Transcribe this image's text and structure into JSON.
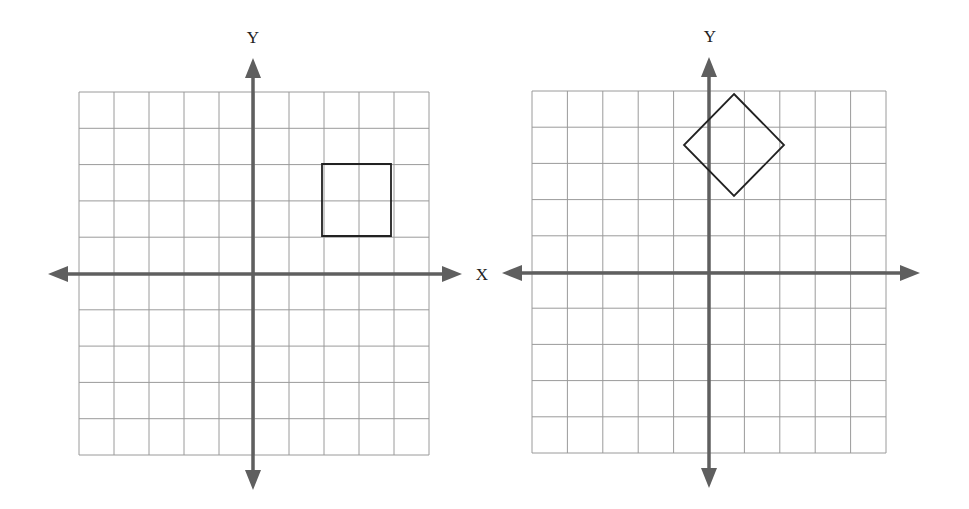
{
  "figure": {
    "colors": {
      "grid": "#9a9a9a",
      "axis": "#5f5f5f",
      "shape": "#222222",
      "background": "#ffffff"
    }
  },
  "graphs": [
    {
      "id": "left",
      "x_label": "X",
      "y_label": "Y",
      "grid": {
        "x0": 79,
        "y0": 92,
        "x1": 429,
        "y1": 455,
        "cols": 10,
        "rows": 10
      },
      "axes": {
        "y_axis_x": 253,
        "x_axis_y": 274,
        "x_left_tip": 48,
        "x_right_tip": 462,
        "y_top_tip": 58,
        "y_bottom_tip": 490
      },
      "shape": {
        "type": "square",
        "points": [
          [
            322,
            164
          ],
          [
            391,
            164
          ],
          [
            391,
            236
          ],
          [
            322,
            236
          ]
        ]
      },
      "label_positions": {
        "y": [
          253,
          38
        ],
        "x": [
          482,
          275
        ]
      }
    },
    {
      "id": "right",
      "x_label": "",
      "y_label": "Y",
      "grid": {
        "x0": 532,
        "y0": 91,
        "x1": 886,
        "y1": 453,
        "cols": 10,
        "rows": 10
      },
      "axes": {
        "y_axis_x": 709,
        "x_axis_y": 273,
        "x_left_tip": 502,
        "x_right_tip": 920,
        "y_top_tip": 57,
        "y_bottom_tip": 488
      },
      "shape": {
        "type": "rotated-square",
        "points": [
          [
            734,
            94
          ],
          [
            784,
            145
          ],
          [
            734,
            196
          ],
          [
            684,
            145
          ]
        ]
      },
      "label_positions": {
        "y": [
          710,
          37
        ]
      }
    }
  ]
}
